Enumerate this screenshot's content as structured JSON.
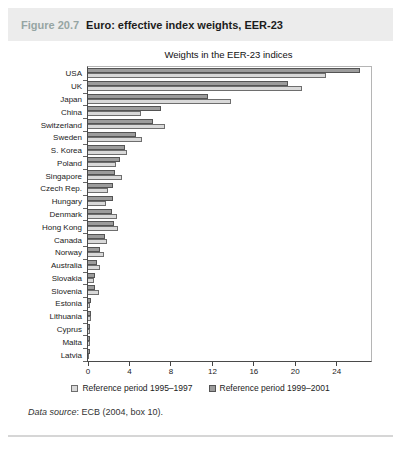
{
  "header": {
    "figure_label": "Figure 20.7",
    "title": "Euro: effective index weights, EER-23",
    "label_color": "#96a5a3",
    "band_bg": "#ececec"
  },
  "source_note": {
    "prefix_italic": "Data source",
    "rest": ": ECB (2004, box 10)."
  },
  "chart_data": {
    "type": "bar",
    "orientation": "horizontal",
    "title": "Weights in the EER-23 indices",
    "xlabel": "",
    "ylabel": "",
    "grid": false,
    "legend_position": "bottom",
    "axis": {
      "min": 0,
      "max": 27.3,
      "ticks": [
        0,
        4,
        8,
        12,
        16,
        20,
        24
      ]
    },
    "categories": [
      "USA",
      "UK",
      "Japan",
      "China",
      "Switzerland",
      "Sweden",
      "S. Korea",
      "Poland",
      "Singapore",
      "Czech Rep.",
      "Hungary",
      "Denmark",
      "Hong Kong",
      "Canada",
      "Norway",
      "Australia",
      "Slovakia",
      "Slovenia",
      "Estonia",
      "Lithuania",
      "Cyprus",
      "Malta",
      "Latvia"
    ],
    "series": [
      {
        "name": "Reference period 1995–1997",
        "color": "#d9d9d9",
        "border": "#6e6e6e",
        "values": [
          23.0,
          20.6,
          13.8,
          5.1,
          7.4,
          5.2,
          3.8,
          2.7,
          3.3,
          1.9,
          1.7,
          2.8,
          2.9,
          1.8,
          1.5,
          1.2,
          0.6,
          1.1,
          0.2,
          0.3,
          0.2,
          0.2,
          0.1
        ]
      },
      {
        "name": "Reference period 1999–2001",
        "color": "#9c9c9c",
        "border": "#545454",
        "values": [
          26.2,
          19.3,
          11.6,
          7.0,
          6.3,
          4.6,
          3.6,
          3.1,
          2.6,
          2.4,
          2.4,
          2.3,
          2.5,
          1.6,
          1.2,
          0.9,
          0.7,
          0.7,
          0.3,
          0.3,
          0.2,
          0.2,
          0.2
        ]
      }
    ],
    "bar_order_hint": "1999–2001 (dark) bar drawn above 1995–1997 (light) bar in each category group"
  }
}
